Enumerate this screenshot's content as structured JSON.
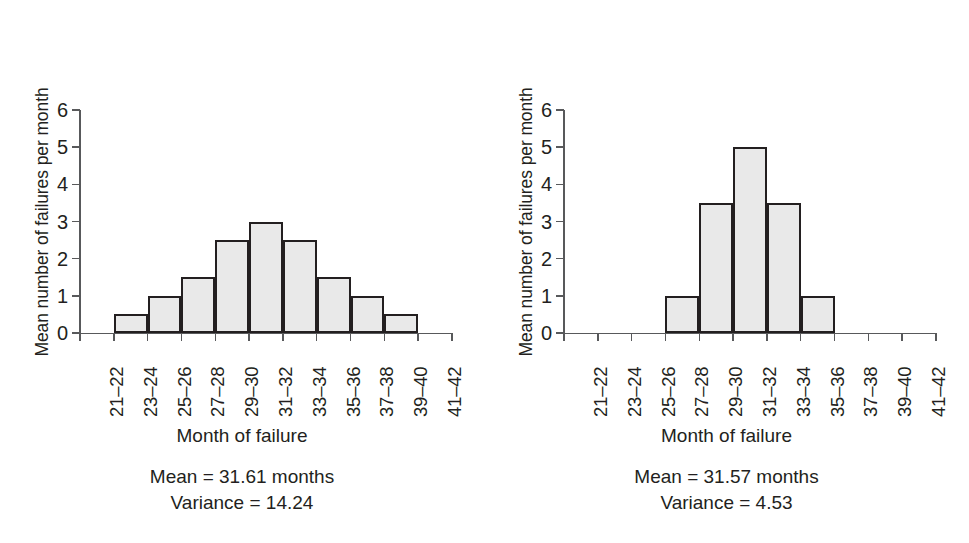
{
  "figure": {
    "background": "#ffffff",
    "bar_fill": "#e9e9e9",
    "bar_stroke": "#231f20",
    "axis_color": "#58595b"
  },
  "chart_data": [
    {
      "type": "bar",
      "id": "left-histogram",
      "title": "",
      "xlabel": "Month of failure",
      "ylabel": "Mean number of failures per month",
      "ylim": [
        0,
        6
      ],
      "yticks": [
        0,
        1,
        2,
        3,
        4,
        5,
        6
      ],
      "ytick_labels": [
        "0",
        "1",
        "2",
        "3",
        "4",
        "5",
        "6"
      ],
      "grid": false,
      "legend": "none",
      "categories": [
        "21–22",
        "23–24",
        "25–26",
        "27–28",
        "29–30",
        "31–32",
        "33–34",
        "35–36",
        "37–38",
        "39–40",
        "41–42"
      ],
      "values": [
        0,
        0.5,
        1,
        1.5,
        2.5,
        3,
        2.5,
        1.5,
        1,
        0.5,
        0
      ],
      "annotations": {
        "mean": "Mean = 31.61 months",
        "variance": "Variance = 14.24"
      }
    },
    {
      "type": "bar",
      "id": "right-histogram",
      "title": "",
      "xlabel": "Month of failure",
      "ylabel": "Mean number of failures per month",
      "ylim": [
        0,
        6
      ],
      "yticks": [
        0,
        1,
        2,
        3,
        4,
        5,
        6
      ],
      "ytick_labels": [
        "0",
        "1",
        "2",
        "3",
        "4",
        "5",
        "6"
      ],
      "grid": false,
      "legend": "none",
      "categories": [
        "21–22",
        "23–24",
        "25–26",
        "27–28",
        "29–30",
        "31–32",
        "33–34",
        "35–36",
        "37–38",
        "39–40",
        "41–42"
      ],
      "values": [
        0,
        0,
        0,
        1,
        3.5,
        5,
        3.5,
        1,
        0,
        0,
        0
      ],
      "annotations": {
        "mean": "Mean = 31.57 months",
        "variance": "Variance = 4.53"
      }
    }
  ]
}
